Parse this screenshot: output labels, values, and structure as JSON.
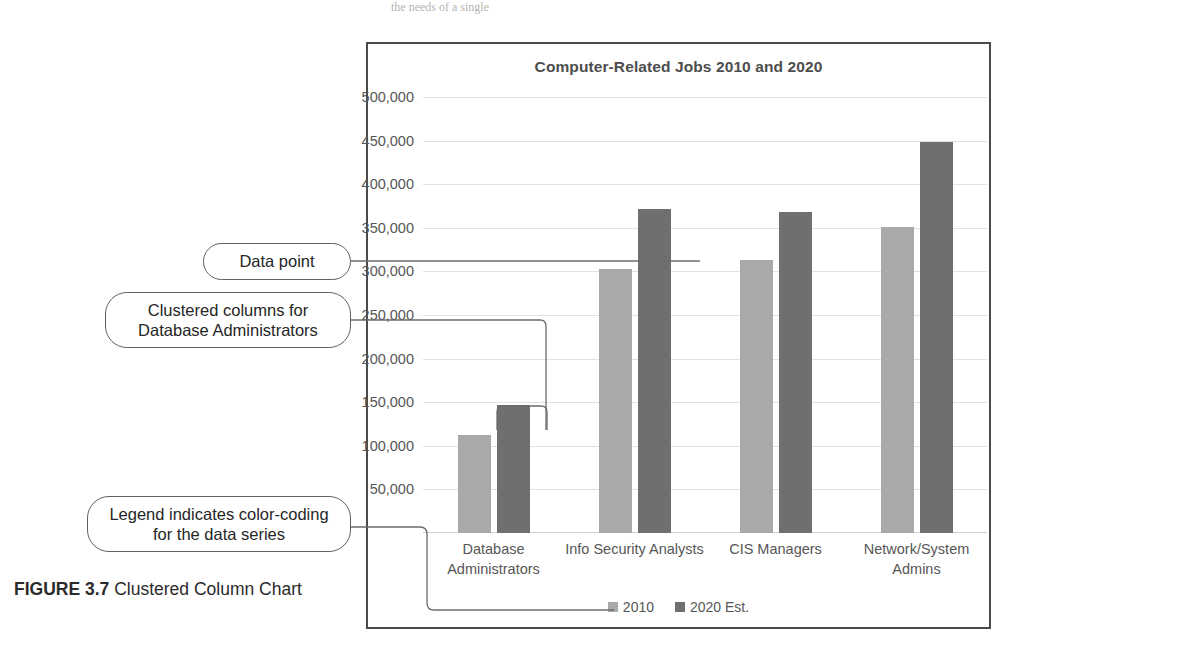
{
  "page": {
    "top_remnant": "the needs of a single",
    "caption_figure": "FIGURE 3.7",
    "caption_text": " Clustered Column Chart"
  },
  "callouts": [
    {
      "id": "data-point",
      "text": "Data point"
    },
    {
      "id": "clustered-columns",
      "text": "Clustered columns for Database Administrators"
    },
    {
      "id": "legend-note",
      "text": "Legend indicates color-coding for the data series"
    }
  ],
  "colors": {
    "series_2010": "#a9a9a9",
    "series_2020": "#6f6f6f",
    "frame": "#4a4a4a",
    "gridline": "#e3e1df",
    "text": "#565656"
  },
  "chart_data": {
    "type": "bar",
    "title": "Computer-Related Jobs 2010 and 2020",
    "xlabel": "",
    "ylabel": "",
    "categories": [
      "Database Administrators",
      "Info Security Analysts",
      "CIS Managers",
      "Network/System Admins"
    ],
    "series": [
      {
        "name": "2010",
        "color": "#a9a9a9",
        "values": [
          112000,
          303000,
          313000,
          351000
        ]
      },
      {
        "name": "2020 Est.",
        "color": "#6f6f6f",
        "values": [
          147000,
          372000,
          368000,
          448000
        ]
      }
    ],
    "ylim": [
      0,
      500000
    ],
    "yticks": [
      50000,
      100000,
      150000,
      200000,
      250000,
      300000,
      350000,
      400000,
      450000,
      500000
    ],
    "ytick_labels": [
      "50,000",
      "100,000",
      "150,000",
      "200,000",
      "250,000",
      "300,000",
      "350,000",
      "400,000",
      "450,000",
      "500,000"
    ],
    "grid": true,
    "legend": [
      "2010",
      "2020 Est."
    ],
    "legend_position": "bottom",
    "annotations": [
      {
        "label": "Data point",
        "target": "Info Security Analysts 2020 Est. column"
      },
      {
        "label": "Clustered columns for Database Administrators",
        "target": "Database Administrators cluster"
      },
      {
        "label": "Legend indicates color-coding for the data series",
        "target": "legend"
      }
    ]
  }
}
